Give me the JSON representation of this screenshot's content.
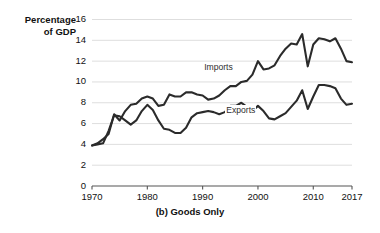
{
  "chart_data": {
    "type": "line",
    "title": "",
    "caption": "(b) Goods Only",
    "ylabel": "Percentage\nof GDP",
    "xlabel": "",
    "xlim": [
      1970,
      2017
    ],
    "ylim": [
      0,
      16
    ],
    "yticks": [
      0,
      2,
      4,
      6,
      8,
      10,
      12,
      14,
      16
    ],
    "ytick_labels": [
      "0",
      "2",
      "4",
      "6",
      "8",
      "10",
      "12",
      "14",
      "16"
    ],
    "xticks": [
      1970,
      1980,
      1990,
      2000,
      2010,
      2017
    ],
    "xtick_labels": [
      "1970",
      "1980",
      "1990",
      "2000",
      "2010",
      "2017"
    ],
    "grid": "horizontal",
    "legend_position": "inline-annotations",
    "line_color": "#2b2b2b",
    "grid_color": "#dedede",
    "axis_color": "#555555",
    "background": "#ffffff",
    "x": [
      1970,
      1971,
      1972,
      1973,
      1974,
      1975,
      1976,
      1977,
      1978,
      1979,
      1980,
      1981,
      1982,
      1983,
      1984,
      1985,
      1986,
      1987,
      1988,
      1989,
      1990,
      1991,
      1992,
      1993,
      1994,
      1995,
      1996,
      1997,
      1998,
      1999,
      2000,
      2001,
      2002,
      2003,
      2004,
      2005,
      2006,
      2007,
      2008,
      2009,
      2010,
      2011,
      2012,
      2013,
      2014,
      2015,
      2016,
      2017
    ],
    "series": [
      {
        "name": "Imports",
        "label": "Imports",
        "label_x": 1993,
        "label_y": 11.3,
        "values": [
          3.9,
          4.1,
          4.5,
          5.0,
          6.9,
          6.3,
          7.2,
          7.8,
          7.9,
          8.4,
          8.6,
          8.4,
          7.7,
          7.8,
          8.8,
          8.6,
          8.6,
          9.0,
          9.0,
          8.8,
          8.7,
          8.3,
          8.4,
          8.7,
          9.2,
          9.6,
          9.6,
          10.0,
          10.1,
          10.7,
          12.0,
          11.2,
          11.3,
          11.6,
          12.5,
          13.2,
          13.7,
          13.6,
          14.6,
          11.5,
          13.6,
          14.2,
          14.1,
          13.9,
          14.2,
          13.2,
          12.0,
          11.9
        ]
      },
      {
        "name": "Exports",
        "label": "Exports",
        "label_x": 1997,
        "label_y": 7.2,
        "values": [
          3.9,
          4.0,
          4.1,
          5.3,
          6.8,
          6.7,
          6.3,
          5.9,
          6.3,
          7.2,
          7.8,
          7.3,
          6.3,
          5.5,
          5.4,
          5.1,
          5.1,
          5.6,
          6.6,
          7.0,
          7.1,
          7.2,
          7.1,
          6.9,
          7.1,
          7.7,
          7.7,
          8.0,
          7.6,
          7.2,
          7.7,
          7.2,
          6.5,
          6.4,
          6.7,
          7.0,
          7.6,
          8.2,
          9.2,
          7.4,
          8.6,
          9.7,
          9.7,
          9.6,
          9.4,
          8.4,
          7.8,
          7.9
        ]
      }
    ]
  }
}
